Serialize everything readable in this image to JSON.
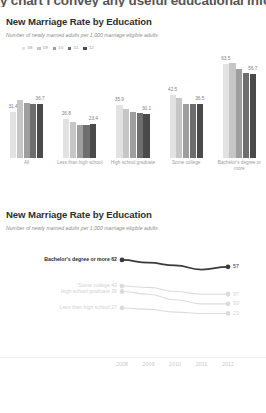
{
  "cutoff_headline": "y chart I convey any useful educational inform",
  "bar_chart": {
    "title": "New Marriage Rate by Education",
    "subtitle": "Number of newly married adults per 1,000 marriage eligible adults",
    "legend": [
      {
        "label": "'08",
        "color": "#e2e2e2"
      },
      {
        "label": "'09",
        "color": "#c6c6c6"
      },
      {
        "label": "'10",
        "color": "#9e9e9e"
      },
      {
        "label": "'11",
        "color": "#6e6e6e"
      },
      {
        "label": "'12",
        "color": "#4a4a4a"
      }
    ]
  },
  "line_chart": {
    "title": "New Marriage Rate by Education",
    "subtitle": "Number of newly married adults per 1,000 marriage eligible adults"
  },
  "chart_data": [
    {
      "type": "bar",
      "title": "New Marriage Rate by Education",
      "subtitle": "Number of newly married adults per 1,000 marriage eligible adults",
      "xlabel": "",
      "ylabel": "Number of newly married adults per 1,000 marriage eligible adults",
      "ylim": [
        0,
        70
      ],
      "grid": false,
      "legend_position": "top-left",
      "categories": [
        "All",
        "Less than high school",
        "High school graduate",
        "Some college",
        "Bachelor's degree or more"
      ],
      "series": [
        {
          "name": "'08",
          "color": "#e2e2e2",
          "values": [
            31.4,
            26.8,
            35.9,
            42.5,
            63.5
          ]
        },
        {
          "name": "'09",
          "color": "#c6c6c6",
          "values": [
            39.1,
            24.2,
            33.0,
            40.4,
            64.3
          ]
        },
        {
          "name": "'10",
          "color": "#9e9e9e",
          "values": [
            37.4,
            22.4,
            31.0,
            36.3,
            60.0
          ]
        },
        {
          "name": "'11",
          "color": "#6e6e6e",
          "values": [
            36.3,
            22.6,
            30.4,
            36.4,
            57.5
          ]
        },
        {
          "name": "'12",
          "color": "#4a4a4a",
          "values": [
            36.7,
            23.4,
            30.1,
            36.5,
            56.7
          ]
        }
      ],
      "data_labels": [
        {
          "category": "All",
          "series": "'08",
          "value": 31.4
        },
        {
          "category": "All",
          "series": "'12",
          "value": 36.7
        },
        {
          "category": "Less than high school",
          "series": "'08",
          "value": 26.8
        },
        {
          "category": "Less than high school",
          "series": "'12",
          "value": 23.4
        },
        {
          "category": "High school graduate",
          "series": "'08",
          "value": 35.9
        },
        {
          "category": "High school graduate",
          "series": "'12",
          "value": 30.1
        },
        {
          "category": "Some college",
          "series": "'08",
          "value": 42.5
        },
        {
          "category": "Some college",
          "series": "'12",
          "value": 36.5
        },
        {
          "category": "Bachelor's degree or more",
          "series": "'08",
          "value": 63.5
        },
        {
          "category": "Bachelor's degree or more",
          "series": "'12",
          "value": 56.7
        }
      ]
    },
    {
      "type": "line",
      "title": "New Marriage Rate by Education",
      "subtitle": "Number of newly married adults per 1,000 marriage eligible adults",
      "xlabel": "",
      "ylabel": "Number of newly married adults per 1,000 marriage eligible adults",
      "x": [
        "2008",
        "2009",
        "2010",
        "2011",
        "2012"
      ],
      "ylim": [
        0,
        70
      ],
      "grid": false,
      "legend_position": "left-labels",
      "series": [
        {
          "name": "Bachelor's degree or more",
          "color": "#3a3a3a",
          "start_value": 62,
          "end_value": 57,
          "values": [
            62,
            60,
            58,
            55,
            57
          ]
        },
        {
          "name": "Some college",
          "color": "#dcdcdc",
          "start_value": 43,
          "end_value": 37,
          "values": [
            43,
            42,
            39,
            37,
            37
          ]
        },
        {
          "name": "High school graduate",
          "color": "#dcdcdc",
          "start_value": 39,
          "end_value": 30,
          "values": [
            39,
            37,
            33,
            30,
            30
          ]
        },
        {
          "name": "Less than high school",
          "color": "#dcdcdc",
          "start_value": 27,
          "end_value": 23,
          "values": [
            27,
            26,
            24,
            23,
            23
          ]
        }
      ]
    }
  ]
}
